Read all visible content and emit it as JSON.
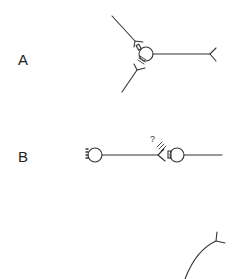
{
  "figure": {
    "panels": [
      {
        "id": "A",
        "label": "A"
      },
      {
        "id": "B",
        "label": "B",
        "annotation": "?"
      },
      {
        "id": "C",
        "label": ""
      }
    ]
  },
  "colors": {
    "stroke": "#333333",
    "background": "#ffffff"
  }
}
